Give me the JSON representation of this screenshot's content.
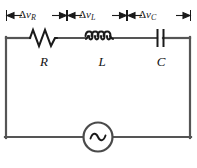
{
  "figure": {
    "type": "series-rlc-ac-circuit-diagram",
    "background_color": "#ffffff",
    "wire_color": "#4d4d4d",
    "ink_color": "#1a1a1a"
  },
  "dimension_bar": {
    "segments": [
      {
        "id": "vR",
        "delta": "Δ",
        "quantity": "v",
        "subscript": "R",
        "full": "Δv_R"
      },
      {
        "id": "vL",
        "delta": "Δ",
        "quantity": "v",
        "subscript": "L",
        "full": "Δv_L"
      },
      {
        "id": "vC",
        "delta": "Δ",
        "quantity": "v",
        "subscript": "C",
        "full": "Δv_C"
      }
    ]
  },
  "components": [
    {
      "id": "resistor",
      "symbol": "zigzag",
      "label": "R",
      "peaks": 4
    },
    {
      "id": "inductor",
      "symbol": "coil",
      "label": "L",
      "loops": 4
    },
    {
      "id": "capacitor",
      "symbol": "parallel-plates",
      "label": "C",
      "plates": 2
    },
    {
      "id": "ac-source",
      "symbol": "circle-with-sine",
      "label": "~"
    }
  ],
  "source": {
    "glyph": "∼",
    "name": "ac-voltage-source"
  }
}
